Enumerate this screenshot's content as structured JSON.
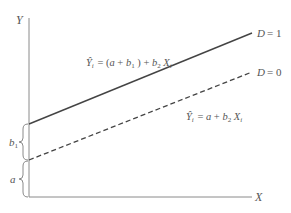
{
  "diagram": {
    "type": "dummy-variable-intercept-shift",
    "axes": {
      "y_label": "Y",
      "x_label": "X"
    },
    "lines": [
      {
        "id": "d1",
        "style": "solid",
        "label": "D = 1",
        "equation": {
          "lhs": "Ŷ",
          "lhs_sub": "i",
          "rhs_parts": [
            "= (",
            "a",
            " + ",
            "b",
            "1",
            ") + ",
            "b",
            "2",
            "X",
            "i"
          ]
        }
      },
      {
        "id": "d0",
        "style": "dashed",
        "label": "D = 0",
        "equation": {
          "lhs": "Ŷ",
          "lhs_sub": "i",
          "rhs_parts": [
            "= ",
            "a",
            " + ",
            "b",
            "2",
            "X",
            "i"
          ]
        }
      }
    ],
    "braces": [
      {
        "id": "b1",
        "label": "b",
        "label_sub": "1",
        "meaning": "intercept shift"
      },
      {
        "id": "a",
        "label": "a",
        "meaning": "base intercept"
      }
    ],
    "colors": {
      "axis": "#8a8a8a",
      "line": "#444444",
      "text": "#555555",
      "background": "#ffffff"
    }
  }
}
